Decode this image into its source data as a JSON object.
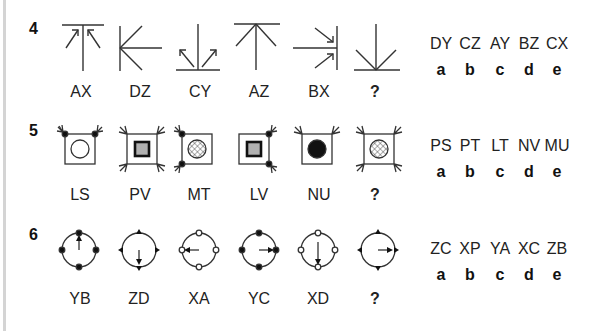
{
  "questions": [
    {
      "number": "4",
      "figures": [
        {
          "label": "AX",
          "shape": "top-bar-with-two-inward-arrows"
        },
        {
          "label": "DZ",
          "shape": "left-bar-fan"
        },
        {
          "label": "CY",
          "shape": "bottom-bar-with-two-outward-arrows"
        },
        {
          "label": "AZ",
          "shape": "top-bar-fan"
        },
        {
          "label": "BX",
          "shape": "right-bar-with-two-inward-arrows"
        },
        {
          "label": "?",
          "shape": "bottom-bar-fan"
        }
      ],
      "options": [
        {
          "code": "DY",
          "letter": "a"
        },
        {
          "code": "CZ",
          "letter": "b"
        },
        {
          "code": "AY",
          "letter": "c"
        },
        {
          "code": "BZ",
          "letter": "d"
        },
        {
          "code": "CX",
          "letter": "e"
        }
      ]
    },
    {
      "number": "5",
      "figures": [
        {
          "label": "LS",
          "shape": "square-circle-top-dots"
        },
        {
          "label": "PV",
          "shape": "square-gray-square-four-arrows"
        },
        {
          "label": "MT",
          "shape": "square-hatched-circle-left-dots"
        },
        {
          "label": "LV",
          "shape": "square-gray-square-right-dots"
        },
        {
          "label": "NU",
          "shape": "square-black-circle-top-arrows"
        },
        {
          "label": "?",
          "shape": "square-hatched-circle-four-arrows"
        }
      ],
      "options": [
        {
          "code": "PS",
          "letter": "a"
        },
        {
          "code": "PT",
          "letter": "b"
        },
        {
          "code": "LT",
          "letter": "c"
        },
        {
          "code": "NV",
          "letter": "d"
        },
        {
          "code": "MU",
          "letter": "e"
        }
      ]
    },
    {
      "number": "6",
      "figures": [
        {
          "label": "YB",
          "shape": "circle-black-dots-arrow-up"
        },
        {
          "label": "ZD",
          "shape": "circle-triangles-arrow-down"
        },
        {
          "label": "XA",
          "shape": "circle-white-dots-arrow-left"
        },
        {
          "label": "YC",
          "shape": "circle-black-dots-arrow-right"
        },
        {
          "label": "XD",
          "shape": "circle-white-dots-arrow-down"
        },
        {
          "label": "?",
          "shape": "circle-triangles-arrow-right"
        }
      ],
      "options": [
        {
          "code": "ZC",
          "letter": "a"
        },
        {
          "code": "XP",
          "letter": "b"
        },
        {
          "code": "YA",
          "letter": "c"
        },
        {
          "code": "XC",
          "letter": "d"
        },
        {
          "code": "ZB",
          "letter": "e"
        }
      ]
    }
  ]
}
